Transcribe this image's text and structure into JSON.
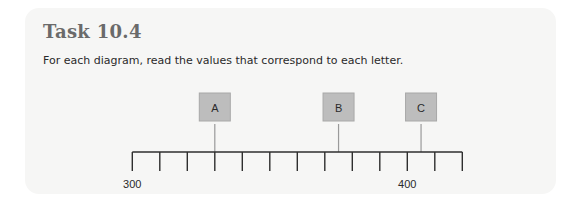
{
  "task": {
    "title": "Task 10.4",
    "instruction": "For each diagram, read the values that correspond to each letter."
  },
  "chart_data": {
    "type": "number_line",
    "axis": {
      "start_value": 300,
      "tick_step": 10,
      "tick_count": 13,
      "range": [
        300,
        420
      ],
      "labeled_ticks": [
        {
          "value": 300,
          "label": "300"
        },
        {
          "value": 400,
          "label": "400"
        }
      ]
    },
    "markers": [
      {
        "letter": "A",
        "value": 330
      },
      {
        "letter": "B",
        "value": 375
      },
      {
        "letter": "C",
        "value": 405
      }
    ]
  },
  "layout": {
    "x0": 132.3,
    "px_per_unit": 2.75,
    "axis_y": 152,
    "tick_bottom": 171,
    "box_top": 93,
    "box_size": 31,
    "label_y": 188
  }
}
